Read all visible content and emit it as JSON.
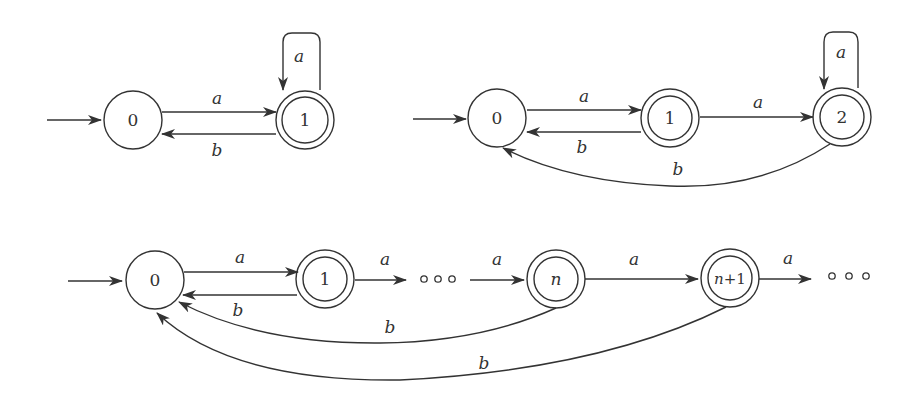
{
  "diagrams": [
    {
      "name": "automaton-1",
      "states": [
        {
          "id": "0",
          "label": "0",
          "accepting": false,
          "initial": true
        },
        {
          "id": "1",
          "label": "1",
          "accepting": true
        }
      ],
      "transitions": [
        {
          "from": "0",
          "to": "1",
          "label": "a"
        },
        {
          "from": "1",
          "to": "0",
          "label": "b"
        },
        {
          "from": "1",
          "to": "1",
          "label": "a"
        }
      ]
    },
    {
      "name": "automaton-2",
      "states": [
        {
          "id": "0",
          "label": "0",
          "accepting": false,
          "initial": true
        },
        {
          "id": "1",
          "label": "1",
          "accepting": true
        },
        {
          "id": "2",
          "label": "2",
          "accepting": true
        }
      ],
      "transitions": [
        {
          "from": "0",
          "to": "1",
          "label": "a"
        },
        {
          "from": "1",
          "to": "0",
          "label": "b"
        },
        {
          "from": "1",
          "to": "2",
          "label": "a"
        },
        {
          "from": "2",
          "to": "2",
          "label": "a"
        },
        {
          "from": "2",
          "to": "0",
          "label": "b"
        }
      ]
    },
    {
      "name": "automaton-infinite",
      "states": [
        {
          "id": "0",
          "label": "0",
          "accepting": false,
          "initial": true
        },
        {
          "id": "1",
          "label": "1",
          "accepting": true
        },
        {
          "id": "n",
          "label": "n",
          "accepting": true
        },
        {
          "id": "n+1",
          "label": "n+1",
          "accepting": true
        }
      ],
      "ellipsis": "∘ ∘ ∘",
      "transitions": [
        {
          "from": "0",
          "to": "1",
          "label": "a"
        },
        {
          "from": "1",
          "to": "0",
          "label": "b"
        },
        {
          "from": "1",
          "to": "…",
          "label": "a"
        },
        {
          "from": "…",
          "to": "n",
          "label": "a"
        },
        {
          "from": "n",
          "to": "n+1",
          "label": "a"
        },
        {
          "from": "n+1",
          "to": "…",
          "label": "a"
        },
        {
          "from": "n",
          "to": "0",
          "label": "b"
        },
        {
          "from": "n+1",
          "to": "0",
          "label": "b"
        }
      ]
    }
  ],
  "labels": {
    "a": "a",
    "b": "b",
    "s0": "0",
    "s1": "1",
    "s2": "2",
    "sn": "n",
    "sn1_n": "n",
    "sn1_plus": "+1"
  }
}
